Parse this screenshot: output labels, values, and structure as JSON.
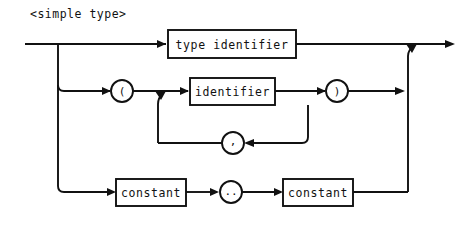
{
  "diagram": {
    "title": "<simple type>",
    "kind": "railroad-syntax-diagram",
    "stroke_color": "#111111",
    "background_color": "#ffffff",
    "entry_label": "",
    "exit_label": "",
    "branches": [
      {
        "id": "branch-type-identifier",
        "row": 1,
        "nodes": [
          {
            "id": "node-type-identifier",
            "shape": "box",
            "label": "type identifier"
          }
        ]
      },
      {
        "id": "branch-enumerated",
        "row": 2,
        "nodes": [
          {
            "id": "node-open-paren",
            "shape": "circle",
            "label": "("
          },
          {
            "id": "node-identifier",
            "shape": "box",
            "label": "identifier"
          },
          {
            "id": "node-close-paren",
            "shape": "circle",
            "label": ")"
          }
        ],
        "loop": {
          "id": "loop-comma",
          "nodes": [
            {
              "id": "node-comma",
              "shape": "circle",
              "label": ","
            }
          ]
        }
      },
      {
        "id": "branch-subrange",
        "row": 3,
        "nodes": [
          {
            "id": "node-constant-low",
            "shape": "box",
            "label": "constant"
          },
          {
            "id": "node-range-dots",
            "shape": "circle",
            "label": ".."
          },
          {
            "id": "node-constant-high",
            "shape": "box",
            "label": "constant"
          }
        ]
      }
    ]
  }
}
